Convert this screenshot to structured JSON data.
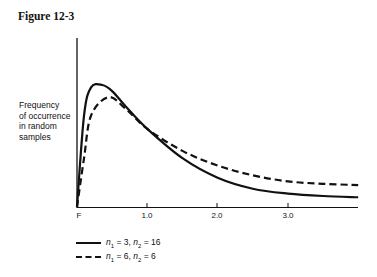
{
  "figure": {
    "title": "Figure 12-3"
  },
  "chart_data": {
    "type": "line",
    "title": "Figure 12-3",
    "xlabel": "",
    "ylabel": "Frequency of occurrence in random samples",
    "ylabel_lines": [
      "Frequency",
      "of occurrence",
      "in random",
      "samples"
    ],
    "x_tick_labels": [
      "F",
      "1.0",
      "2.0",
      "3.0"
    ],
    "x_ticks": [
      0,
      1.0,
      2.0,
      3.0
    ],
    "xlim": [
      0,
      4.0
    ],
    "grid": false,
    "legend_position": "below",
    "series": [
      {
        "name": "n1 = 3, n2 = 16",
        "style": "solid",
        "x": [
          0,
          0.1,
          0.2,
          0.36,
          0.5,
          0.7,
          1.0,
          1.5,
          2.0,
          2.5,
          3.0,
          3.5,
          4.0
        ],
        "y": [
          0,
          0.75,
          0.98,
          1.0,
          0.95,
          0.82,
          0.64,
          0.4,
          0.24,
          0.15,
          0.11,
          0.09,
          0.08
        ]
      },
      {
        "name": "n1 = 6, n2 = 6",
        "style": "dashed",
        "x": [
          0,
          0.1,
          0.2,
          0.45,
          0.7,
          1.0,
          1.5,
          2.0,
          2.5,
          3.0,
          3.5,
          4.0
        ],
        "y": [
          0,
          0.4,
          0.75,
          0.9,
          0.8,
          0.64,
          0.46,
          0.34,
          0.26,
          0.21,
          0.19,
          0.18
        ]
      }
    ]
  },
  "legend": {
    "items": [
      {
        "n1": "3",
        "n2": "16"
      },
      {
        "n1": "6",
        "n2": "6"
      }
    ]
  }
}
